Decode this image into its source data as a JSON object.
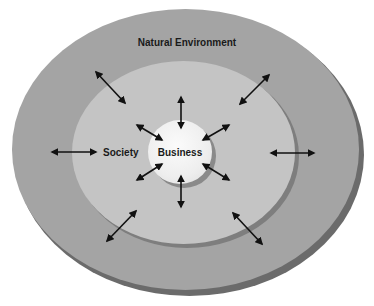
{
  "diagram": {
    "type": "nested-ellipses",
    "layers": [
      {
        "id": "natural-environment",
        "label": "Natural Environment",
        "color": "#a4a4a4"
      },
      {
        "id": "society",
        "label": "Society",
        "color": "#c4c4c4"
      },
      {
        "id": "business",
        "label": "Business",
        "color": "#efefef"
      }
    ],
    "arrows": {
      "style": "double-headed",
      "color": "#111111",
      "business_society_count": 6,
      "society_environment_count": 6
    }
  }
}
